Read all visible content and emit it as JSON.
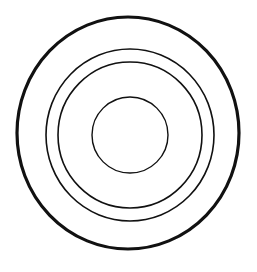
{
  "diagram": {
    "type": "concentric-circles",
    "background": "#ffffff",
    "stroke_color": "#111111",
    "rings": [
      {
        "name": "outer-ring",
        "cx": 128,
        "cy": 133,
        "rx": 111,
        "ry": 116,
        "stroke_width": 3.2
      },
      {
        "name": "second-ring",
        "cx": 130,
        "cy": 135,
        "rx": 84,
        "ry": 86,
        "stroke_width": 1.6
      },
      {
        "name": "third-ring",
        "cx": 130,
        "cy": 135,
        "rx": 72,
        "ry": 73,
        "stroke_width": 1.6
      },
      {
        "name": "inner-ring",
        "cx": 130,
        "cy": 135,
        "rx": 38,
        "ry": 38,
        "stroke_width": 1.4
      }
    ]
  }
}
